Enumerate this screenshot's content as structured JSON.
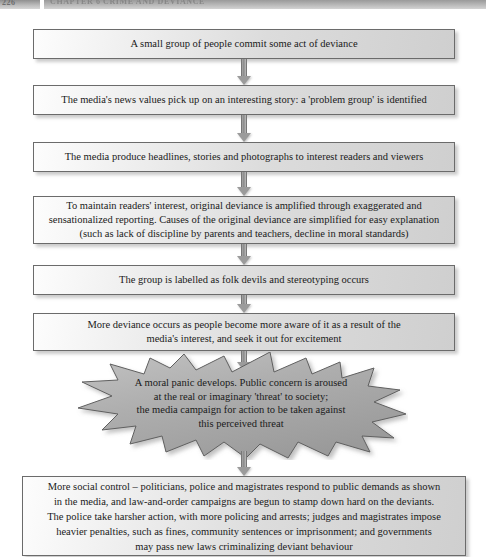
{
  "page_header": {
    "folio": "226",
    "running_head": "CHAPTER 6  CRIME AND DEVIANCE"
  },
  "flowchart": {
    "title": "The deviancy amplification spiral / moral panic process",
    "accent_border": "#6b6b6b",
    "box_fill_light": "#fdfdfd",
    "box_fill_dark": "#cfcfcf",
    "arrow_color": "#9b9b9b",
    "starburst_fill": "#a9a9a9",
    "steps": [
      {
        "id": "step-1",
        "shape": "rectangle",
        "text": "A small group of people commit some act of deviance"
      },
      {
        "id": "step-2",
        "shape": "rectangle",
        "text": "The media's news values pick up on an interesting story: a 'problem group' is identified"
      },
      {
        "id": "step-3",
        "shape": "rectangle",
        "text": "The media produce headlines, stories and photographs to interest readers and viewers"
      },
      {
        "id": "step-4",
        "shape": "rectangle",
        "text": "To maintain readers' interest, original deviance is amplified through exaggerated and\nsensationalized reporting. Causes of the original deviance are simplified for easy explanation\n(such as lack of discipline by parents and teachers, decline in moral standards)"
      },
      {
        "id": "step-5",
        "shape": "rectangle",
        "text": "The group is labelled as folk devils and stereotyping occurs"
      },
      {
        "id": "step-6",
        "shape": "rectangle",
        "text": "More deviance occurs as people become more aware of it as a result of the\nmedia's interest, and seek it out for excitement"
      },
      {
        "id": "step-7",
        "shape": "starburst",
        "text": "A moral panic develops. Public concern is aroused\nat the real or imaginary 'threat' to society;\nthe media campaign for action to be taken against\nthis perceived threat"
      },
      {
        "id": "step-8",
        "shape": "rectangle",
        "text": "More social control – politicians, police and magistrates respond to public demands as shown\nin the media, and law-and-order campaigns are begun to stamp down hard on the deviants.\nThe police take harsher action, with more policing and arrests; judges and magistrates impose\nheavier penalties, such as fines, community sentences or imprisonment; and governments\nmay pass new laws criminalizing deviant behaviour"
      }
    ],
    "connectors": [
      {
        "id": "connector-1",
        "from": "step-1",
        "to": "step-2",
        "icon": "arrow-down-icon"
      },
      {
        "id": "connector-2",
        "from": "step-2",
        "to": "step-3",
        "icon": "arrow-down-icon"
      },
      {
        "id": "connector-3",
        "from": "step-3",
        "to": "step-4",
        "icon": "arrow-down-icon"
      },
      {
        "id": "connector-4",
        "from": "step-4",
        "to": "step-5",
        "icon": "arrow-down-icon"
      },
      {
        "id": "connector-5",
        "from": "step-5",
        "to": "step-6",
        "icon": "arrow-down-icon"
      },
      {
        "id": "connector-6",
        "from": "step-6",
        "to": "step-7",
        "icon": "arrow-down-icon"
      },
      {
        "id": "connector-7",
        "from": "step-7",
        "to": "step-8",
        "icon": "arrow-down-icon"
      }
    ]
  }
}
